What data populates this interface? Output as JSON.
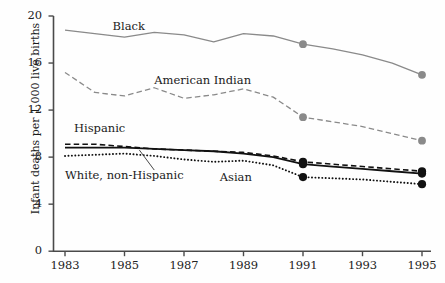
{
  "chart_data": {
    "type": "line",
    "title": "",
    "xlabel": "",
    "ylabel": "Infant deaths per 1,000 live births",
    "x": [
      1983,
      1984,
      1985,
      1986,
      1987,
      1988,
      1989,
      1990,
      1991,
      1992,
      1993,
      1994,
      1995
    ],
    "xlim": [
      1982.5,
      1995.6
    ],
    "ylim": [
      0,
      20
    ],
    "xticks": [
      "1983",
      "1985",
      "1987",
      "1989",
      "1991",
      "1993",
      "1995"
    ],
    "xtick_values": [
      1983,
      1985,
      1987,
      1989,
      1991,
      1993,
      1995
    ],
    "yticks": [
      "0",
      "4",
      "8",
      "12",
      "16",
      "20"
    ],
    "ytick_values": [
      0,
      4,
      8,
      12,
      16,
      20
    ],
    "grid": false,
    "legend": "inline-labels",
    "series": [
      {
        "name": "Black",
        "label": "Black",
        "style": "solid",
        "color": "#8a8a8a",
        "width": 1.3,
        "markers_at": [
          1991,
          1995
        ],
        "values": [
          18.8,
          18.5,
          18.2,
          18.6,
          18.4,
          17.8,
          18.5,
          18.3,
          17.6,
          17.2,
          16.7,
          16.0,
          15.0
        ]
      },
      {
        "name": "American Indian",
        "label": "American Indian",
        "style": "dashed",
        "color": "#8a8a8a",
        "width": 1.3,
        "markers_at": [
          1991,
          1995
        ],
        "values": [
          15.2,
          13.5,
          13.2,
          13.9,
          13.0,
          13.3,
          13.8,
          13.1,
          11.4,
          11.0,
          10.6,
          10.0,
          9.4
        ]
      },
      {
        "name": "Hispanic",
        "label": "Hispanic",
        "style": "dashed",
        "color": "#111111",
        "width": 1.6,
        "markers_at": [
          1991,
          1995
        ],
        "values": [
          9.1,
          9.1,
          8.9,
          8.7,
          8.6,
          8.5,
          8.4,
          8.1,
          7.6,
          7.4,
          7.2,
          7.0,
          6.8
        ]
      },
      {
        "name": "White, non-Hispanic",
        "label": "White, non-Hispanic",
        "style": "solid",
        "color": "#111111",
        "width": 1.8,
        "markers_at": [
          1991,
          1995
        ],
        "values": [
          8.8,
          8.8,
          8.8,
          8.7,
          8.6,
          8.5,
          8.3,
          8.0,
          7.4,
          7.2,
          7.0,
          6.8,
          6.6
        ]
      },
      {
        "name": "Asian",
        "label": "Asian",
        "style": "dotted",
        "color": "#111111",
        "width": 1.9,
        "markers_at": [
          1991,
          1995
        ],
        "values": [
          8.1,
          8.2,
          8.3,
          8.1,
          7.8,
          7.6,
          7.7,
          7.3,
          6.3,
          6.2,
          6.1,
          5.9,
          5.7
        ]
      }
    ],
    "annotations": [
      {
        "text": "Black",
        "x": 1984.6,
        "y": 19.1
      },
      {
        "text": "American Indian",
        "x": 1986.0,
        "y": 14.5
      },
      {
        "text": "Hispanic",
        "x": 1983.3,
        "y": 10.4
      },
      {
        "text": "White, non-Hispanic",
        "x": 1983.0,
        "y": 6.4
      },
      {
        "text": "Asian",
        "x": 1988.2,
        "y": 6.2
      }
    ],
    "leader_line": {
      "from_x": 1986.0,
      "from_y": 6.9,
      "to_x": 1985.5,
      "to_y": 8.6
    }
  },
  "axes": {
    "y_title": "Infant deaths per 1,000 live births"
  }
}
